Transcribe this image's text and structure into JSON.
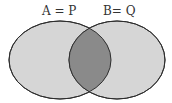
{
  "diagram": {
    "type": "venn",
    "sets": [
      {
        "id": "A",
        "label": "A = P"
      },
      {
        "id": "B",
        "label": "B= Q"
      }
    ],
    "intersection": {
      "sets": [
        "A",
        "B"
      ],
      "shaded": true
    },
    "colors": {
      "set_fill": "#d6d6d6",
      "intersection_fill": "#8a8a8a",
      "stroke": "#2e2e2e",
      "label": "#333333"
    }
  }
}
